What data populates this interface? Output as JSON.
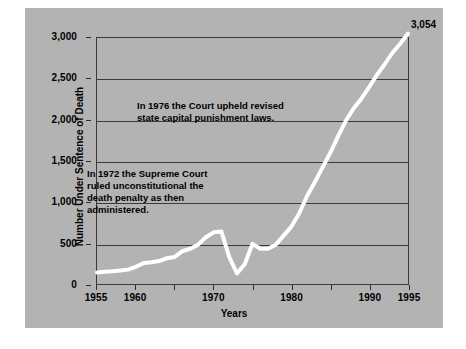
{
  "chart_data": {
    "type": "line",
    "title": "",
    "xlabel": "Years",
    "ylabel": "Number Under Sentence of Death",
    "xlim": [
      1955,
      1995
    ],
    "ylim": [
      0,
      3000
    ],
    "grid": true,
    "legend_position": "none",
    "x_tick_labels": [
      "1955",
      "1960",
      "1970",
      "1980",
      "1990",
      "1995"
    ],
    "x_tick_values": [
      1955,
      1960,
      1970,
      1980,
      1990,
      1995
    ],
    "x_tick_marks": [
      1955,
      1960,
      1965,
      1970,
      1975,
      1980,
      1985,
      1990,
      1995
    ],
    "y_tick_labels": [
      "0",
      "500",
      "1,000",
      "1,500",
      "2,000",
      "2,500",
      "3,000"
    ],
    "y_tick_values": [
      0,
      500,
      1000,
      1500,
      2000,
      2500,
      3000
    ],
    "series": [
      {
        "name": "Number under sentence of death",
        "color": "#ffffff",
        "x": [
          1955,
          1956,
          1957,
          1958,
          1959,
          1960,
          1961,
          1962,
          1963,
          1964,
          1965,
          1966,
          1967,
          1968,
          1969,
          1970,
          1971,
          1972,
          1973,
          1974,
          1975,
          1976,
          1977,
          1978,
          1979,
          1980,
          1981,
          1982,
          1983,
          1984,
          1985,
          1986,
          1987,
          1988,
          1989,
          1990,
          1991,
          1992,
          1993,
          1994,
          1995
        ],
        "values": [
          140,
          150,
          155,
          165,
          175,
          210,
          255,
          265,
          280,
          315,
          330,
          400,
          430,
          480,
          570,
          630,
          640,
          330,
          130,
          240,
          490,
          430,
          430,
          480,
          590,
          700,
          860,
          1070,
          1240,
          1420,
          1600,
          1800,
          1990,
          2140,
          2260,
          2400,
          2550,
          2680,
          2820,
          2930,
          3054
        ]
      }
    ],
    "annotations": [
      {
        "name": "annotation-1976",
        "text": "In 1976 the Court upheld revised\nstate capital punishment laws."
      },
      {
        "name": "annotation-1972",
        "text": "In 1972 the Supreme Court\nruled unconstitutional the\ndeath penalty as then\nadministered."
      }
    ],
    "endpoint_label": "3,054"
  },
  "colors": {
    "panel_background": "#b3b3b3",
    "page_background": "#ffffff",
    "line": "#ffffff",
    "axis": "#3a3a3a",
    "text": "#000000"
  }
}
